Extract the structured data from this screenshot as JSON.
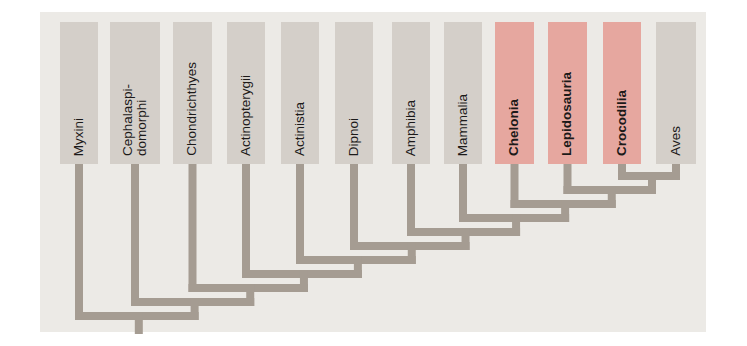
{
  "diagram": {
    "type": "cladogram",
    "orientation": "root-bottom, tips-top",
    "colors": {
      "panel_bg": "#eceae6",
      "taxon_box": "#d4cfc9",
      "highlight_box": "#e6a79f",
      "branch": "#a59c92",
      "label_text": "#1c1a19"
    },
    "taxa": [
      {
        "label": "Myxini",
        "highlighted": false
      },
      {
        "label": "Cephalaspi-\ndomorphi",
        "highlighted": false
      },
      {
        "label": "Chondrichthyes",
        "highlighted": false
      },
      {
        "label": "Actinopterygii",
        "highlighted": false
      },
      {
        "label": "Actinistia",
        "highlighted": false
      },
      {
        "label": "Dipnoi",
        "highlighted": false
      },
      {
        "label": "Amphibia",
        "highlighted": false
      },
      {
        "label": "Mammalia",
        "highlighted": false
      },
      {
        "label": "Chelonia",
        "highlighted": true
      },
      {
        "label": "Lepidosauria",
        "highlighted": true
      },
      {
        "label": "Crocodilia",
        "highlighted": true
      },
      {
        "label": "Aves",
        "highlighted": false
      }
    ],
    "topology": "(Myxini,(Cephalaspidomorphi,(Chondrichthyes,(Actinopterygii,(Actinistia,(Dipnoi,(Amphibia,(Mammalia,(Chelonia,(Lepidosauria,(Crocodilia,Aves)))))))))))"
  }
}
